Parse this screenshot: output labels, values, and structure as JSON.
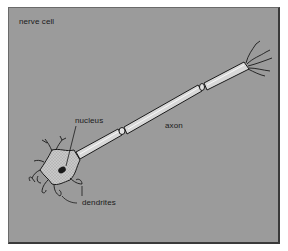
{
  "figure": {
    "title": "nerve cell",
    "labels": {
      "nucleus": "nucleus",
      "axon": "axon",
      "dendrites": "dendrites"
    },
    "colors": {
      "background": "#9b9b9b",
      "frame_border": "#3a3a3a",
      "axon_fill": "#d8d8d8",
      "soma_fill": "#c4c4c4",
      "outline": "#1a1a1a"
    }
  }
}
